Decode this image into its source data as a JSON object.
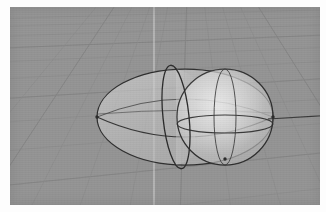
{
  "app": {
    "title": "3D Viewport",
    "viewport_label": "perspective-viewport"
  },
  "scene": {
    "background_color": "#949494",
    "page_background_color": "#fdfdfd",
    "grid": {
      "enabled": true,
      "minor_line_color": "#8a8a8a",
      "major_line_color": "#7e7e7e",
      "axis_y_color": "#d8d8d8",
      "axis_x_color": "#3a3a3a",
      "projection": "perspective",
      "horizon_y": -40,
      "minor_divisions": 16,
      "major_every": 4
    },
    "objects": [
      {
        "name": "ellipsoid",
        "type": "ellipsoid",
        "label": "Ellipsoid",
        "surface_color": "#c2c2c2",
        "wire_color": "#2e2e2e",
        "center": [
          175,
          110
        ],
        "radius_x": 88,
        "radius_y": 48,
        "opacity": 0.55
      },
      {
        "name": "sphere",
        "type": "sphere",
        "label": "Sphere",
        "surface_color": "#c8c8c8",
        "wire_color": "#2e2e2e",
        "center": [
          215,
          110
        ],
        "radius": 48,
        "opacity": 0.55
      },
      {
        "name": "intersection-ring",
        "type": "ellipse-curve",
        "label": "Intersection Curve",
        "wire_color": "#2a2a2a",
        "center": [
          165,
          110
        ],
        "radius_x": 13,
        "radius_y": 52,
        "tilt_deg": -6
      }
    ],
    "axes": {
      "x_axis_visible": true,
      "y_axis_visible": true,
      "x_axis_y_position": 109,
      "y_axis_x_position": 144
    }
  }
}
